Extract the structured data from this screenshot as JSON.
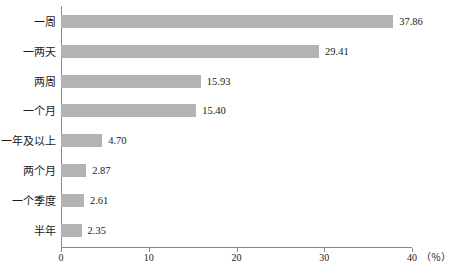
{
  "chart_data": {
    "type": "bar",
    "orientation": "horizontal",
    "title": "",
    "xlabel": "",
    "ylabel": "",
    "unit_label": "（％）",
    "xlim": [
      0,
      40
    ],
    "xticks": [
      0,
      10,
      20,
      30,
      40
    ],
    "xtick_labels": [
      "0",
      "10",
      "20",
      "30",
      "40"
    ],
    "grid": false,
    "legend": null,
    "bar_color": "#b3b3b3",
    "axis_color": "#8a8a8a",
    "categories": [
      "一周",
      "一两天",
      "两周",
      "一个月",
      "一年及以上",
      "两个月",
      "一个季度",
      "半年"
    ],
    "values": [
      37.86,
      29.41,
      15.93,
      15.4,
      4.7,
      2.87,
      2.61,
      2.35
    ],
    "value_labels": [
      "37.86",
      "29.41",
      "15.93",
      "15.40",
      "4.70",
      "2.87",
      "2.61",
      "2.35"
    ]
  }
}
